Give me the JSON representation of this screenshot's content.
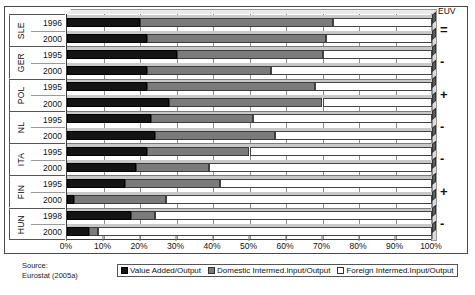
{
  "chart_data": {
    "type": "bar",
    "subtype": "stacked-horizontal-100",
    "title": "",
    "xlabel": "",
    "ylabel": "",
    "xlim": [
      0,
      100
    ],
    "xticks": [
      "0%",
      "10%",
      "20%",
      "30%",
      "40%",
      "50%",
      "60%",
      "70%",
      "80%",
      "90%",
      "100%"
    ],
    "grid": true,
    "legend_position": "bottom",
    "legend": [
      "Value Added/Output",
      "Domestic Intermed.Input/Output",
      "Foreign Intermed.Input/Output"
    ],
    "series": [
      {
        "name": "Value Added/Output",
        "values": [
          20,
          22,
          30,
          22,
          22,
          28,
          23,
          24,
          22,
          19,
          16,
          2,
          17.5,
          6
        ]
      },
      {
        "name": "Domestic Intermed.Input/Output",
        "values": [
          53,
          49,
          40,
          34,
          46,
          42,
          28,
          33,
          28,
          20,
          26,
          25,
          6.5,
          2.5
        ]
      },
      {
        "name": "Foreign Intermed.Input/Output",
        "values": [
          27,
          29,
          30,
          44,
          32,
          30,
          49,
          43,
          50,
          61,
          58,
          73,
          76,
          91.5
        ]
      }
    ],
    "categories": [
      "SLE 1996",
      "SLE 2000",
      "GER 1995",
      "GER 2000",
      "POL 1995",
      "POL 2000",
      "NL 1995",
      "NL 2000",
      "ITA 1995",
      "ITA 2000",
      "FIN 1995",
      "FIN 2000",
      "HUN 1998",
      "HUN 2000"
    ],
    "colors": {
      "value_added": "#141414",
      "domestic": "#7b7b7b",
      "foreign": "#ffffff"
    }
  },
  "countries": [
    {
      "name": "SLE",
      "euv": "=",
      "rows": [
        {
          "year": "1996",
          "va": 20,
          "dom": 53,
          "fgn": 27
        },
        {
          "year": "2000",
          "va": 22,
          "dom": 49,
          "fgn": 29
        }
      ]
    },
    {
      "name": "GER",
      "euv": "-",
      "rows": [
        {
          "year": "1995",
          "va": 30,
          "dom": 40,
          "fgn": 30
        },
        {
          "year": "2000",
          "va": 22,
          "dom": 34,
          "fgn": 44
        }
      ]
    },
    {
      "name": "POL",
      "euv": "+",
      "rows": [
        {
          "year": "1995",
          "va": 22,
          "dom": 46,
          "fgn": 32
        },
        {
          "year": "2000",
          "va": 28,
          "dom": 42,
          "fgn": 30
        }
      ]
    },
    {
      "name": "NL",
      "euv": "-",
      "rows": [
        {
          "year": "1995",
          "va": 23,
          "dom": 28,
          "fgn": 49
        },
        {
          "year": "2000",
          "va": 24,
          "dom": 33,
          "fgn": 43
        }
      ]
    },
    {
      "name": "ITA",
      "euv": "-",
      "rows": [
        {
          "year": "1995",
          "va": 22,
          "dom": 28,
          "fgn": 50
        },
        {
          "year": "2000",
          "va": 19,
          "dom": 20,
          "fgn": 61
        }
      ]
    },
    {
      "name": "FIN",
      "euv": "+",
      "rows": [
        {
          "year": "1995",
          "va": 16,
          "dom": 26,
          "fgn": 58
        },
        {
          "year": "2000",
          "va": 2,
          "dom": 25,
          "fgn": 73
        }
      ]
    },
    {
      "name": "HUN",
      "euv": "-",
      "rows": [
        {
          "year": "1998",
          "va": 17.5,
          "dom": 6.5,
          "fgn": 76
        },
        {
          "year": "2000",
          "va": 6,
          "dom": 2.5,
          "fgn": 91.5
        }
      ]
    }
  ],
  "euv": {
    "title": "EUV"
  },
  "source": {
    "line1": "Source:",
    "line2": "Eurostat (2005a)"
  }
}
